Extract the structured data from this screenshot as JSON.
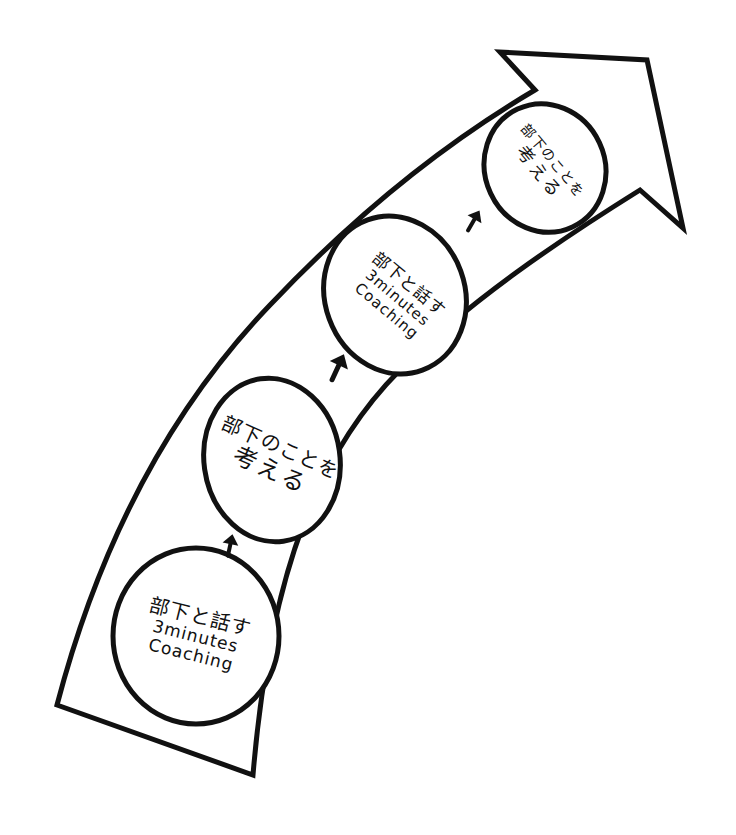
{
  "diagram": {
    "type": "growth-arrow",
    "stroke_color": "#111111",
    "background_color": "#ffffff",
    "steps": [
      {
        "order": 1,
        "line1": "部下と話す",
        "line2": "3minutes",
        "line3": "Coaching"
      },
      {
        "order": 2,
        "line1": "部下のことを",
        "line2": "考える"
      },
      {
        "order": 3,
        "line1": "部下と話す",
        "line2": "3minutes",
        "line3": "Coaching"
      },
      {
        "order": 4,
        "line1": "部下のことを",
        "line2": "考える"
      }
    ],
    "connectors": [
      {
        "from": 1,
        "to": 2,
        "icon": "up-arrow-icon"
      },
      {
        "from": 2,
        "to": 3,
        "icon": "up-arrow-icon"
      },
      {
        "from": 3,
        "to": 4,
        "icon": "up-arrow-icon"
      }
    ]
  }
}
